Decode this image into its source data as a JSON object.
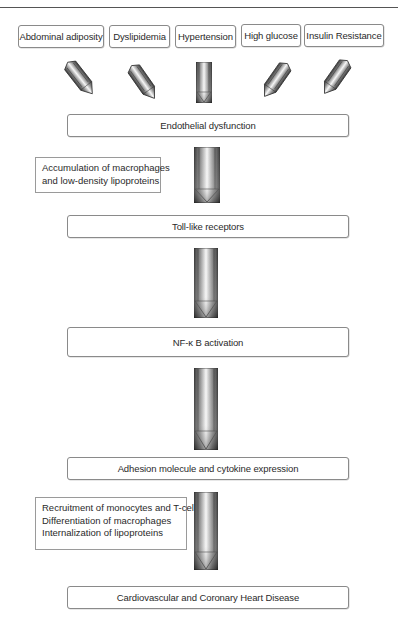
{
  "diagram": {
    "type": "flowchart",
    "risk_factors": [
      {
        "label": "Abdominal adiposity"
      },
      {
        "label": "Dyslipidemia"
      },
      {
        "label": "Hypertension"
      },
      {
        "label": "High glucose"
      },
      {
        "label": "Insulin Resistance"
      }
    ],
    "steps": [
      {
        "label": "Endothelial dysfunction"
      },
      {
        "label": "Toll-like receptors"
      },
      {
        "label": "NF-κ B activation"
      },
      {
        "label": "Adhesion molecule and cytokine expression"
      },
      {
        "label": "Cardiovascular and Coronary Heart Disease"
      }
    ],
    "side_notes": [
      {
        "lines": [
          "Accumulation of macrophages",
          "and low-density lipoproteins"
        ]
      },
      {
        "lines": [
          "Recruitment of monocytes and T-cells",
          "Differentiation of macrophages",
          "Internalization of lipoproteins"
        ]
      }
    ],
    "colors": {
      "border": "#8a8a8a",
      "arrow_dark": "#3c3c3c",
      "arrow_light": "#f4f4f4",
      "text": "#2a2a2a"
    }
  }
}
